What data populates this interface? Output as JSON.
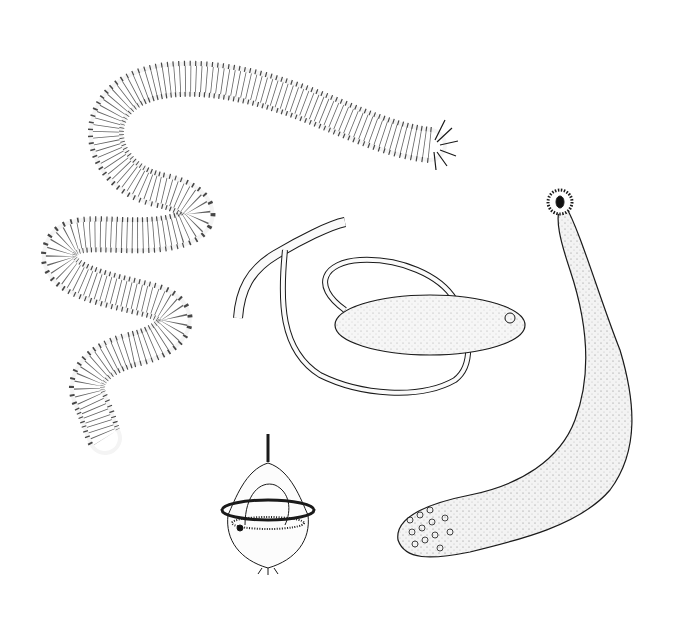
{
  "image": {
    "kind": "scientific line illustration",
    "background": "#ffffff",
    "ink": "#1a1a1a",
    "subjects": [
      {
        "id": "polychaete",
        "label": "segmented polychaete worm with parapodia and head tentacles"
      },
      {
        "id": "echiuran",
        "label": "echiuran worm with long forked proboscis"
      },
      {
        "id": "priapulid",
        "label": "stippled worm with papillate trunk and crowned proboscis"
      },
      {
        "id": "larva",
        "label": "trochophore larva with ciliated band and apical tuft"
      }
    ]
  }
}
